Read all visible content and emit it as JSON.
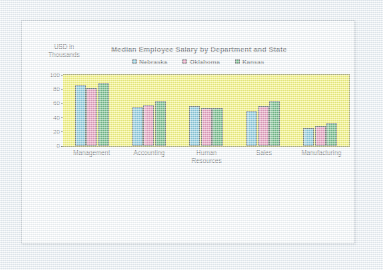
{
  "chart_data": {
    "type": "bar",
    "title": "Median Employee Salary by Department and State",
    "xlabel": "",
    "ylabel": "USD in Thousands",
    "ylabel_lines": [
      "USD in",
      "Thousands"
    ],
    "categories": [
      "Management",
      "Accounting",
      "Human Resources",
      "Sales",
      "Manufacturing"
    ],
    "category_lines": [
      [
        "Management"
      ],
      [
        "Accounting"
      ],
      [
        "Human",
        "Resources"
      ],
      [
        "Sales"
      ],
      [
        "Manufacturing"
      ]
    ],
    "series": [
      {
        "name": "Nebraska",
        "color": "#3fa8c4",
        "values": [
          86,
          55,
          57,
          49,
          25
        ]
      },
      {
        "name": "Oklahoma",
        "color": "#d9598c",
        "values": [
          82,
          58,
          53,
          57,
          28
        ]
      },
      {
        "name": "Kansas",
        "color": "#138c30",
        "values": [
          89,
          64,
          53,
          63,
          32
        ]
      }
    ],
    "ylim": [
      0,
      100
    ],
    "yticks": [
      100,
      80,
      60,
      40,
      20,
      0
    ],
    "grid": false,
    "legend_position": "top-center",
    "plot_background_color": "#f5f01c",
    "page_background_color": "#eef1f4",
    "card_background_color": "#fdfdfd"
  }
}
